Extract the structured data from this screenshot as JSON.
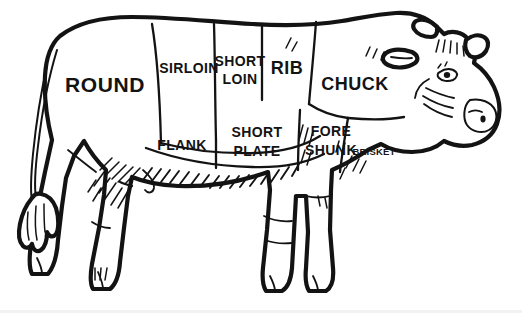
{
  "diagram": {
    "style": "line-art",
    "colors": {
      "background": "#ffffff",
      "ink": "#131313",
      "base_band": "#f2f2f2"
    },
    "cuts": [
      {
        "id": "round",
        "label": "ROUND",
        "lines": [
          "ROUND"
        ],
        "size": "xl",
        "x": 105,
        "y": 86,
        "region": "hindquarter"
      },
      {
        "id": "sirloin",
        "label": "SIRLOIN",
        "lines": [
          "SIRLOIN"
        ],
        "size": "md",
        "x": 189,
        "y": 69,
        "region": "upper-back"
      },
      {
        "id": "short-loin",
        "label": "SHORT LOIN",
        "lines": [
          "SHORT",
          "LOIN"
        ],
        "size": "md",
        "x": 240,
        "y": 69,
        "region": "upper-back"
      },
      {
        "id": "rib",
        "label": "RIB",
        "lines": [
          "RIB"
        ],
        "size": "lg",
        "x": 287,
        "y": 71,
        "region": "upper-back"
      },
      {
        "id": "chuck",
        "label": "CHUCK",
        "lines": [
          "CHUCK"
        ],
        "size": "lg",
        "x": 355,
        "y": 85,
        "region": "shoulder"
      },
      {
        "id": "flank",
        "label": "FLANK",
        "lines": [
          "FLANK"
        ],
        "size": "md",
        "x": 182,
        "y": 146,
        "region": "belly"
      },
      {
        "id": "short-plate",
        "label": "SHORT PLATE",
        "lines": [
          "SHORT",
          "PLATE"
        ],
        "size": "md",
        "x": 257,
        "y": 139,
        "region": "belly"
      },
      {
        "id": "fore-shunk",
        "label": "FORE SHUNK",
        "lines": [
          "FORE",
          "SHUNK"
        ],
        "size": "md",
        "x": 331,
        "y": 139,
        "region": "foreleg"
      },
      {
        "id": "brisket",
        "label": "BRISKET",
        "lines": [
          "BRISKET"
        ],
        "size": "xs",
        "x": 374,
        "y": 152,
        "region": "chest"
      }
    ]
  }
}
